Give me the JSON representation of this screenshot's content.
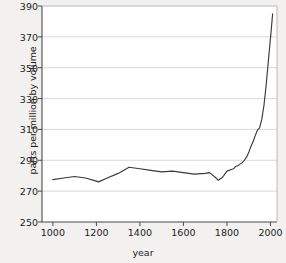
{
  "chart_data": {
    "type": "line",
    "title": "",
    "subtitle": "",
    "xlabel": "year",
    "ylabel": "parts per million by volume",
    "xlim": [
      950,
      2030
    ],
    "ylim": [
      250,
      390
    ],
    "xticks": [
      1000,
      1200,
      1400,
      1600,
      1800,
      2000
    ],
    "yticks": [
      250,
      270,
      290,
      310,
      330,
      350,
      370,
      390
    ],
    "grid": "horizontal",
    "legend": "none",
    "line_color": "#3a3a3a",
    "plot_background": "#ffffff",
    "figure_background": "#f2f1ef",
    "series": [
      {
        "name": "CO2 concentration",
        "x": [
          1000,
          1050,
          1100,
          1150,
          1200,
          1210,
          1250,
          1300,
          1350,
          1400,
          1450,
          1500,
          1550,
          1600,
          1650,
          1700,
          1720,
          1750,
          1760,
          1780,
          1800,
          1820,
          1830,
          1840,
          1850,
          1860,
          1870,
          1880,
          1890,
          1900,
          1910,
          1920,
          1930,
          1940,
          1950,
          1960,
          1970,
          1980,
          1990,
          2000,
          2010
        ],
        "y": [
          277.5,
          278.5,
          279.5,
          278.5,
          276.5,
          276.0,
          278.5,
          281.5,
          285.5,
          284.5,
          283.5,
          282.5,
          283.0,
          282.0,
          281.0,
          281.5,
          282.0,
          278.5,
          277.0,
          279.0,
          283.0,
          284.0,
          284.5,
          286.0,
          286.5,
          287.5,
          288.5,
          290.0,
          292.0,
          295.0,
          299.0,
          302.0,
          306.0,
          309.5,
          311.0,
          316.5,
          325.5,
          338.5,
          354.0,
          369.0,
          385.0
        ]
      }
    ]
  },
  "axes": {
    "y_tick_labels": [
      "390",
      "370",
      "350",
      "330",
      "310",
      "290",
      "270",
      "250"
    ],
    "x_tick_labels": [
      "1000",
      "1200",
      "1400",
      "1600",
      "1800",
      "2000"
    ],
    "y_axis_title": "parts per million by volume",
    "x_axis_title": "year"
  }
}
